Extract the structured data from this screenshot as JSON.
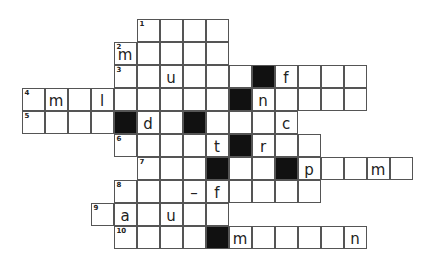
{
  "puzzle": {
    "type": "crossword",
    "origin_x": 22,
    "origin_y": 19,
    "cell_size": 23,
    "rows": [
      {
        "row": 0,
        "number": "1",
        "start": 5,
        "end": 8,
        "black": [],
        "letters": {}
      },
      {
        "row": 1,
        "number": "2",
        "start": 4,
        "end": 8,
        "black": [],
        "letters": {
          "4": "m"
        }
      },
      {
        "row": 2,
        "number": "3",
        "start": 4,
        "end": 14,
        "black": [
          10
        ],
        "letters": {
          "6": "u",
          "11": "f"
        }
      },
      {
        "row": 3,
        "number": "4",
        "start": 0,
        "end": 14,
        "black": [
          9
        ],
        "letters": {
          "1": "m",
          "3": "l",
          "10": "n"
        }
      },
      {
        "row": 4,
        "number": "5",
        "start": 0,
        "end": 11,
        "black": [
          4,
          7
        ],
        "letters": {
          "5": "d",
          "11": "c"
        }
      },
      {
        "row": 5,
        "number": "6",
        "start": 4,
        "end": 12,
        "black": [
          9
        ],
        "letters": {
          "8": "t",
          "10": "r"
        }
      },
      {
        "row": 6,
        "number": "7",
        "start": 5,
        "end": 16,
        "black": [
          8,
          11
        ],
        "letters": {
          "12": "p",
          "15": "m"
        }
      },
      {
        "row": 7,
        "number": "8",
        "start": 4,
        "end": 12,
        "black": [],
        "letters": {
          "7": "–",
          "8": "f"
        }
      },
      {
        "row": 8,
        "number": "9",
        "start": 3,
        "end": 8,
        "black": [],
        "letters": {
          "4": "a",
          "6": "u"
        }
      },
      {
        "row": 9,
        "number": "10",
        "start": 4,
        "end": 14,
        "black": [
          8
        ],
        "letters": {
          "9": "m",
          "14": "n"
        }
      }
    ]
  }
}
